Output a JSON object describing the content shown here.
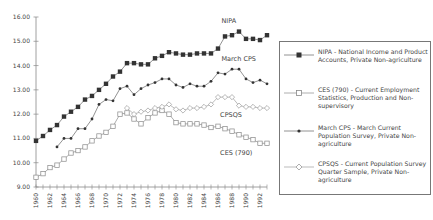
{
  "chart_data": {
    "type": "line",
    "title": "",
    "xlabel": "",
    "ylabel": "",
    "ylim": [
      9.0,
      16.0
    ],
    "xlim": [
      1960,
      1993
    ],
    "grid": false,
    "legend_placement": "right",
    "y_ticks": [
      "9.00",
      "10.00",
      "11.00",
      "12.00",
      "13.00",
      "14.00",
      "15.00",
      "16.00"
    ],
    "y_tick_values": [
      9,
      10,
      11,
      12,
      13,
      14,
      15,
      16
    ],
    "x_tick_labels": [
      "1960",
      "1962",
      "1964",
      "1966",
      "1968",
      "1970",
      "1972",
      "1974",
      "1976",
      "1978",
      "1980",
      "1982",
      "1984",
      "1986",
      "1988",
      "1990",
      "1992"
    ],
    "x_tick_values": [
      1960,
      1962,
      1964,
      1966,
      1968,
      1970,
      1972,
      1974,
      1976,
      1978,
      1980,
      1982,
      1984,
      1986,
      1988,
      1990,
      1992
    ],
    "series": [
      {
        "name": "NIPA",
        "legend": "NIPA - National Income and Product Accounts, Private Non-agriculture",
        "marker": "filled-square",
        "color": "#333333",
        "line_color": "#777777",
        "x_start": 1960,
        "values": [
          10.9,
          11.1,
          11.35,
          11.55,
          11.9,
          12.1,
          12.3,
          12.6,
          12.75,
          13.0,
          13.25,
          13.55,
          13.75,
          14.1,
          14.1,
          14.05,
          14.05,
          14.3,
          14.4,
          14.55,
          14.5,
          14.45,
          14.45,
          14.5,
          14.5,
          14.5,
          14.7,
          15.2,
          15.25,
          15.4,
          15.1,
          15.1,
          15.05,
          15.25
        ]
      },
      {
        "name": "CES (790)",
        "legend": "CES (790) - Current Employment Statistics, Production and Non-supervisory",
        "marker": "open-square",
        "color": "#888888",
        "line_color": "#999999",
        "x_start": 1960,
        "values": [
          9.4,
          9.55,
          9.8,
          9.9,
          10.15,
          10.4,
          10.5,
          10.65,
          10.9,
          11.1,
          11.25,
          11.5,
          12.0,
          12.05,
          11.8,
          11.6,
          11.85,
          12.05,
          12.15,
          12.0,
          11.65,
          11.6,
          11.6,
          11.6,
          11.55,
          11.45,
          11.5,
          11.4,
          11.3,
          11.15,
          11.05,
          10.95,
          10.8,
          10.8
        ]
      },
      {
        "name": "March CPS",
        "legend": "March CPS - March Current Population Survey, Private Non-agriculture",
        "marker": "small-dot",
        "color": "#333333",
        "line_color": "#777777",
        "x_start": 1963,
        "values": [
          10.65,
          11.0,
          11.0,
          11.4,
          11.4,
          11.8,
          12.4,
          12.6,
          12.55,
          13.05,
          13.15,
          12.8,
          13.05,
          13.2,
          13.3,
          13.45,
          13.45,
          13.2,
          13.1,
          13.25,
          13.15,
          13.15,
          13.35,
          13.7,
          13.65,
          13.85,
          13.85,
          13.45,
          13.3,
          13.4,
          13.25
        ]
      },
      {
        "name": "CPSQS",
        "legend": "CPSQS - Current Population Survey Quarter Sample, Private Non-agriculture",
        "marker": "open-diamond",
        "color": "#999999",
        "line_color": "#aaaaaa",
        "x_start": 1973,
        "values": [
          12.25,
          12.0,
          12.1,
          12.15,
          12.25,
          12.3,
          12.4,
          12.2,
          12.15,
          12.25,
          12.25,
          12.3,
          12.4,
          12.7,
          12.7,
          12.7,
          12.35,
          12.3,
          12.3,
          12.25,
          12.25
        ]
      }
    ],
    "annotations": [
      {
        "text": "NIPA",
        "near_series": "NIPA",
        "x": 1986.5,
        "y": 15.75
      },
      {
        "text": "March CPS",
        "near_series": "March CPS",
        "x": 1986.5,
        "y": 14.2
      },
      {
        "text": "CPSQS",
        "near_series": "CPSQS",
        "x": 1986.3,
        "y": 11.9
      },
      {
        "text": "CES (790)",
        "near_series": "CES (790)",
        "x": 1986.3,
        "y": 10.3
      }
    ]
  }
}
